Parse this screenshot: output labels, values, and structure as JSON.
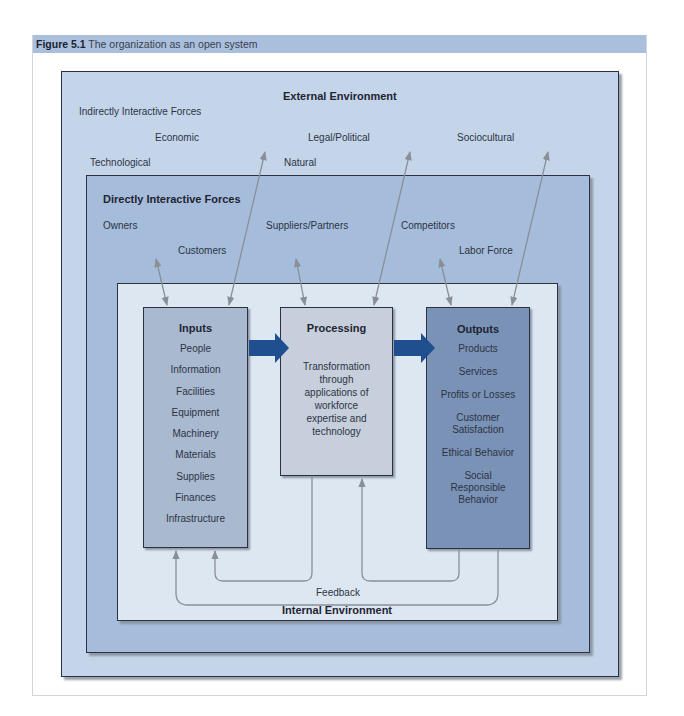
{
  "figure": {
    "number": "Figure 5.1",
    "caption": "The organization as an open system"
  },
  "external": {
    "title": "External Environment",
    "group_label": "Indirectly Interactive Forces",
    "forces": [
      "Economic",
      "Legal/Political",
      "Sociocultural",
      "Technological",
      "Natural"
    ]
  },
  "direct": {
    "title": "Directly Interactive Forces",
    "forces": [
      "Owners",
      "Customers",
      "Suppliers/Partners",
      "Competitors",
      "Labor Force"
    ]
  },
  "internal": {
    "title": "Internal Environment",
    "feedback_label": "Feedback",
    "inputs": {
      "title": "Inputs",
      "items": [
        "People",
        "Information",
        "Facilities",
        "Equipment",
        "Machinery",
        "Materials",
        "Supplies",
        "Finances",
        "Infrastructure"
      ]
    },
    "processing": {
      "title": "Processing",
      "description_lines": [
        "Transformation",
        "through",
        "applications of",
        "workforce",
        "expertise and",
        "technology"
      ]
    },
    "outputs": {
      "title": "Outputs",
      "items": [
        "Products",
        "Services",
        "Profits or Losses",
        "Customer Satisfaction",
        "Ethical Behavior",
        "Social Responsible Behavior"
      ]
    }
  },
  "colors": {
    "header_bar": "#a9bfdc",
    "outer_env": "#c4d5ea",
    "direct_env": "#a6bcdb",
    "internal_env": "#dde7f2",
    "inputs_box": "#a9b9d0",
    "processing_box": "#c6cfdb",
    "outputs_box": "#7a92b6",
    "flow_arrow": "#1f4f8f",
    "connector": "#8a8f96"
  }
}
